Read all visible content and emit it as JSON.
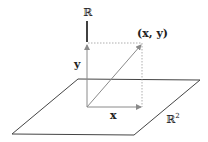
{
  "diagram": {
    "labels": {
      "r_axis": "ℝ",
      "y_component": "y",
      "x_component": "x",
      "point": "(x, y)",
      "plane": "ℝ",
      "plane_exp": "2"
    },
    "colors": {
      "plane": "#444444",
      "arrows": "#8a8a8a",
      "axis_top": "#111111",
      "dotted": "#9a9a9a",
      "text": "#222222"
    },
    "geometry": {
      "origin": [
        87,
        107
      ],
      "point": [
        142,
        43
      ],
      "plane_corners": [
        [
          78,
          79
        ],
        [
          200,
          80
        ],
        [
          134,
          135
        ],
        [
          12,
          134
        ]
      ]
    }
  }
}
